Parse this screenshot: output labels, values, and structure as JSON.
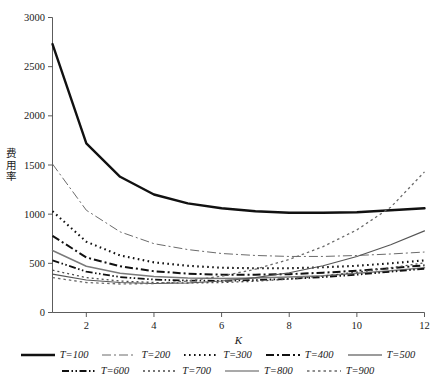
{
  "chart_data": {
    "type": "line",
    "title": "",
    "xlabel": "K",
    "ylabel": "费用率",
    "xlim": [
      1,
      12
    ],
    "ylim": [
      0,
      3000
    ],
    "grid": false,
    "legend_position": "bottom",
    "x": [
      1,
      2,
      3,
      4,
      5,
      6,
      7,
      8,
      9,
      10,
      11,
      12
    ],
    "xticks": [
      "2",
      "4",
      "6",
      "8",
      "10",
      "12"
    ],
    "xtick_values": [
      2,
      4,
      6,
      8,
      10,
      12
    ],
    "yticks": [
      "0",
      "500",
      "1000",
      "1500",
      "2000",
      "2500",
      "3000"
    ],
    "ytick_values": [
      0,
      500,
      1000,
      1500,
      2000,
      2500,
      3000
    ],
    "series": [
      {
        "name": "T=100",
        "style": "solid-thick",
        "color": "#111111",
        "width": 2.4,
        "dash": "none",
        "values": [
          2730,
          1720,
          1380,
          1200,
          1110,
          1060,
          1030,
          1015,
          1015,
          1020,
          1040,
          1060
        ]
      },
      {
        "name": "T=200",
        "style": "dash-dot-thin",
        "color": "#6b6b6b",
        "width": 1.0,
        "dash": "9,3,2,3",
        "values": [
          1510,
          1040,
          820,
          700,
          640,
          600,
          580,
          570,
          570,
          580,
          595,
          615
        ]
      },
      {
        "name": "T=300",
        "style": "dotted-thick",
        "color": "#111111",
        "width": 2.1,
        "dash": "1.6,3.4",
        "values": [
          1030,
          720,
          580,
          510,
          475,
          455,
          450,
          450,
          460,
          475,
          500,
          530
        ]
      },
      {
        "name": "T=400",
        "style": "dash-dot-thick",
        "color": "#111111",
        "width": 2.0,
        "dash": "8,3,2,3",
        "values": [
          780,
          560,
          470,
          420,
          395,
          385,
          385,
          390,
          405,
          425,
          450,
          480
        ]
      },
      {
        "name": "T=500",
        "style": "solid-gray",
        "color": "#7a7a7a",
        "width": 1.5,
        "dash": "none",
        "values": [
          630,
          470,
          400,
          365,
          350,
          345,
          350,
          360,
          375,
          400,
          425,
          455
        ]
      },
      {
        "name": "T=600",
        "style": "dash-dot-dot",
        "color": "#111111",
        "width": 1.8,
        "dash": "7,2.5,1.5,2.5,1.5,2.5",
        "values": [
          530,
          415,
          360,
          335,
          325,
          322,
          330,
          342,
          360,
          385,
          415,
          445
        ]
      },
      {
        "name": "T=700",
        "style": "dotted-thin",
        "color": "#4a4a4a",
        "width": 1.3,
        "dash": "2,3",
        "values": [
          430,
          355,
          320,
          305,
          300,
          305,
          318,
          340,
          370,
          410,
          455,
          505
        ]
      },
      {
        "name": "T=800",
        "style": "solid-thin",
        "color": "#555555",
        "width": 1.1,
        "dash": "none",
        "values": [
          390,
          330,
          305,
          295,
          300,
          320,
          355,
          405,
          475,
          570,
          690,
          830
        ]
      },
      {
        "name": "T=900",
        "style": "dotted-fine",
        "color": "#6b6b6b",
        "width": 1.3,
        "dash": "2.5,3",
        "values": [
          355,
          305,
          290,
          295,
          320,
          370,
          440,
          540,
          670,
          840,
          1070,
          1430
        ]
      }
    ]
  },
  "legend": {
    "rows": [
      [
        {
          "label": "T=100",
          "style": "solid-thick"
        },
        {
          "label": "T=200",
          "style": "dash-dot-thin"
        },
        {
          "label": "T=300",
          "style": "dotted-thick"
        },
        {
          "label": "T=400",
          "style": "dash-dot-thick"
        },
        {
          "label": "T=500",
          "style": "solid-gray"
        }
      ],
      [
        {
          "label": "T=600",
          "style": "dash-dot-dot"
        },
        {
          "label": "T=700",
          "style": "dotted-thin"
        },
        {
          "label": "T=800",
          "style": "solid-thin"
        },
        {
          "label": "T=900",
          "style": "dotted-fine"
        }
      ]
    ]
  },
  "axes": {
    "xlabel": "K",
    "ylabel_chars": [
      "费",
      "用",
      "率"
    ]
  }
}
